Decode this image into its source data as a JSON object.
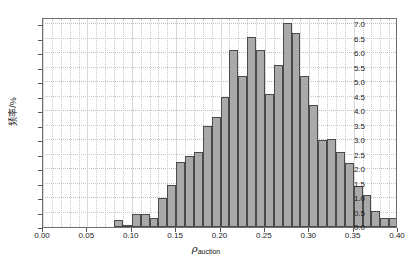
{
  "chart_data": {
    "type": "bar",
    "title": "",
    "subtitle": "",
    "xlabel": "ρ_auction",
    "xlabel_symbol": "ρ",
    "xlabel_subscript": "auction",
    "ylabel": "频率/%",
    "xlim": [
      0.0,
      0.4
    ],
    "ylim": [
      0.0,
      7.25
    ],
    "xticks": [
      "0.00",
      "0.05",
      "0.10",
      "0.15",
      "0.20",
      "0.25",
      "0.30",
      "0.35",
      "0.40"
    ],
    "xtick_values": [
      0.0,
      0.05,
      0.1,
      0.15,
      0.2,
      0.25,
      0.3,
      0.35,
      0.4
    ],
    "yticks": [
      "0.0",
      "0.5",
      "1.0",
      "1.5",
      "2.0",
      "2.5",
      "3.0",
      "3.5",
      "4.0",
      "4.5",
      "5.0",
      "5.5",
      "6.0",
      "6.5",
      "7.0"
    ],
    "ytick_values": [
      0.0,
      0.5,
      1.0,
      1.5,
      2.0,
      2.5,
      3.0,
      3.5,
      4.0,
      4.5,
      5.0,
      5.5,
      6.0,
      6.5,
      7.0
    ],
    "grid": true,
    "legend": null,
    "bin_width": 0.01,
    "bar_color": "#a9a9a9",
    "bar_edge_color": "#4a4a4a",
    "grid_color": "#c9c9c9",
    "axis_color": "#6f6f6f",
    "bins": [
      {
        "x0": 0.08,
        "x1": 0.09,
        "value": 0.25
      },
      {
        "x0": 0.09,
        "x1": 0.1,
        "value": 0.05
      },
      {
        "x0": 0.1,
        "x1": 0.11,
        "value": 0.45
      },
      {
        "x0": 0.11,
        "x1": 0.12,
        "value": 0.45
      },
      {
        "x0": 0.12,
        "x1": 0.13,
        "value": 0.3
      },
      {
        "x0": 0.13,
        "x1": 0.14,
        "value": 1.0
      },
      {
        "x0": 0.14,
        "x1": 0.15,
        "value": 1.45
      },
      {
        "x0": 0.15,
        "x1": 0.16,
        "value": 2.25
      },
      {
        "x0": 0.16,
        "x1": 0.17,
        "value": 2.45
      },
      {
        "x0": 0.17,
        "x1": 0.18,
        "value": 2.6
      },
      {
        "x0": 0.18,
        "x1": 0.19,
        "value": 3.5
      },
      {
        "x0": 0.19,
        "x1": 0.2,
        "value": 3.8
      },
      {
        "x0": 0.2,
        "x1": 0.21,
        "value": 4.5
      },
      {
        "x0": 0.21,
        "x1": 0.22,
        "value": 6.1
      },
      {
        "x0": 0.22,
        "x1": 0.23,
        "value": 5.2
      },
      {
        "x0": 0.23,
        "x1": 0.24,
        "value": 6.55
      },
      {
        "x0": 0.24,
        "x1": 0.25,
        "value": 6.1
      },
      {
        "x0": 0.25,
        "x1": 0.26,
        "value": 4.6
      },
      {
        "x0": 0.26,
        "x1": 0.27,
        "value": 5.6
      },
      {
        "x0": 0.27,
        "x1": 0.28,
        "value": 7.05
      },
      {
        "x0": 0.28,
        "x1": 0.29,
        "value": 6.7
      },
      {
        "x0": 0.29,
        "x1": 0.3,
        "value": 5.2
      },
      {
        "x0": 0.3,
        "x1": 0.31,
        "value": 4.2
      },
      {
        "x0": 0.31,
        "x1": 0.32,
        "value": 3.0
      },
      {
        "x0": 0.32,
        "x1": 0.33,
        "value": 3.05
      },
      {
        "x0": 0.33,
        "x1": 0.34,
        "value": 2.6
      },
      {
        "x0": 0.34,
        "x1": 0.35,
        "value": 2.2
      },
      {
        "x0": 0.35,
        "x1": 0.36,
        "value": 1.4
      },
      {
        "x0": 0.36,
        "x1": 0.37,
        "value": 1.1
      },
      {
        "x0": 0.37,
        "x1": 0.38,
        "value": 0.55
      },
      {
        "x0": 0.38,
        "x1": 0.39,
        "value": 0.3
      },
      {
        "x0": 0.39,
        "x1": 0.4,
        "value": 0.3
      }
    ]
  }
}
